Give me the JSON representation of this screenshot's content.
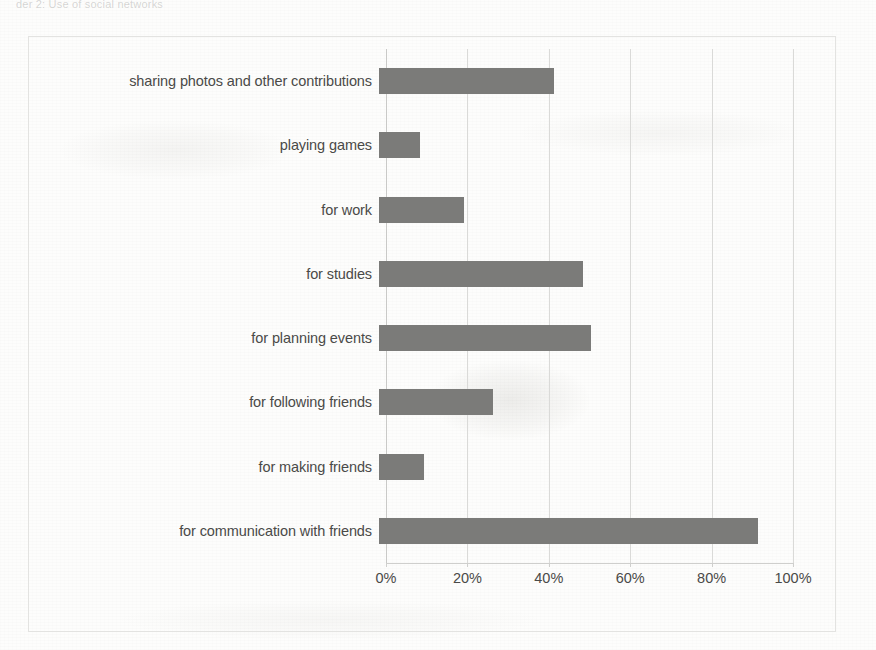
{
  "page": {
    "header_text_faint": "der 2: Use of social networks"
  },
  "chart_data": {
    "type": "bar",
    "orientation": "horizontal",
    "title": "",
    "xlabel": "",
    "ylabel": "",
    "xlim": [
      0,
      100
    ],
    "grid": true,
    "legend": false,
    "x_tick_labels": [
      "0%",
      "20%",
      "40%",
      "60%",
      "80%",
      "100%"
    ],
    "x_tick_values": [
      0,
      20,
      40,
      60,
      80,
      100
    ],
    "bar_color": "#7b7b79",
    "gridline_color": "#dadad8",
    "frame_color": "#e3e3e1",
    "categories": [
      "sharing photos and other contributions",
      "playing games",
      "for work",
      "for studies",
      "for planning events",
      "for following friends",
      "for making friends",
      "for communication with friends"
    ],
    "values": [
      43,
      10,
      21,
      50,
      52,
      28,
      11,
      93
    ],
    "value_unit": "%"
  }
}
